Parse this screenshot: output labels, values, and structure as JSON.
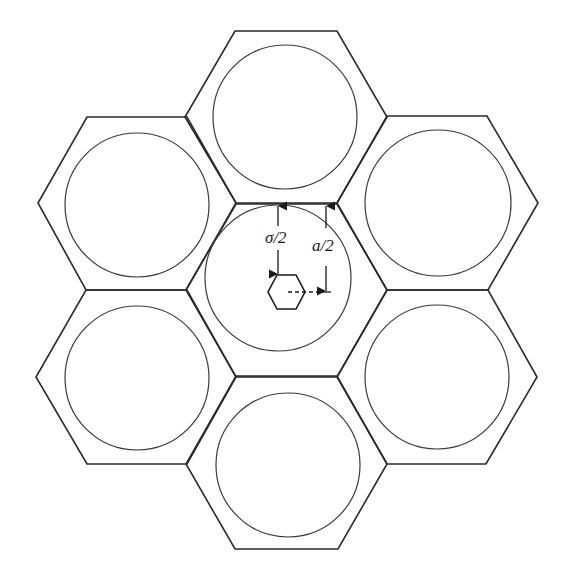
{
  "diagram": {
    "stroke_color": "#2a2a2a",
    "background": "#ffffff",
    "labels": {
      "sigma_half": "σ/2",
      "a_half": "a/2"
    },
    "cells": [
      {
        "id": "top",
        "hex_center": [
          286,
          117
        ],
        "circle_center": [
          285,
          117
        ],
        "circle_r": 72
      },
      {
        "id": "upper-left",
        "hex_center": [
          137,
          203
        ],
        "circle_center": [
          137,
          205
        ],
        "circle_r": 72
      },
      {
        "id": "upper-right",
        "hex_center": [
          437,
          203
        ],
        "circle_center": [
          438,
          203
        ],
        "circle_r": 73
      },
      {
        "id": "center",
        "hex_center": [
          286,
          291
        ],
        "circle_center": [
          278,
          278
        ],
        "circle_r": 73
      },
      {
        "id": "lower-left",
        "hex_center": [
          136,
          377
        ],
        "circle_center": [
          137,
          378
        ],
        "circle_r": 72
      },
      {
        "id": "lower-right",
        "hex_center": [
          437,
          377
        ],
        "circle_center": [
          437,
          377
        ],
        "circle_r": 72
      },
      {
        "id": "bottom",
        "hex_center": [
          287,
          463
        ],
        "circle_center": [
          288,
          465
        ],
        "circle_r": 72
      }
    ],
    "hex_half_width": 100,
    "hex_half_height": 87,
    "small_hexagon": {
      "center": [
        286,
        292
      ],
      "half_width": 18,
      "half_height": 17
    },
    "dimensions": {
      "sigma_half": {
        "x": 278,
        "y_top": 205,
        "y_bottom": 275
      },
      "a_half": {
        "x": 326,
        "y_top": 205,
        "y_bottom": 292,
        "dash_from_x": 286
      }
    }
  }
}
